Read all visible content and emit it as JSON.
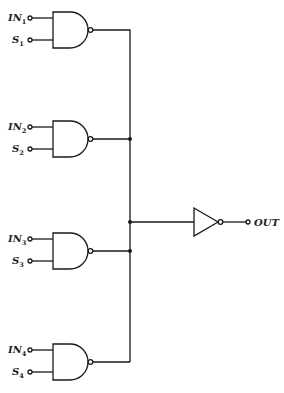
{
  "diagram": {
    "type": "logic-circuit",
    "gates": [
      {
        "id": "nand1",
        "kind": "NAND",
        "inputs": [
          {
            "name": "IN",
            "sub": "1"
          },
          {
            "name": "S",
            "sub": "1"
          }
        ],
        "y": 30
      },
      {
        "id": "nand2",
        "kind": "NAND",
        "inputs": [
          {
            "name": "IN",
            "sub": "2"
          },
          {
            "name": "S",
            "sub": "2"
          }
        ],
        "y": 139
      },
      {
        "id": "nand3",
        "kind": "NAND",
        "inputs": [
          {
            "name": "IN",
            "sub": "3"
          },
          {
            "name": "S",
            "sub": "3"
          }
        ],
        "y": 251
      },
      {
        "id": "nand4",
        "kind": "NAND",
        "inputs": [
          {
            "name": "IN",
            "sub": "4"
          },
          {
            "name": "S",
            "sub": "4"
          }
        ],
        "y": 362
      }
    ],
    "inverter": {
      "id": "not1",
      "kind": "NOT",
      "y": 221
    },
    "output": {
      "label": "OUT"
    },
    "labels": {
      "in1": "IN",
      "in1_sub": "1",
      "s1": "S",
      "s1_sub": "1",
      "in2": "IN",
      "in2_sub": "2",
      "s2": "S",
      "s2_sub": "2",
      "in3": "IN",
      "in3_sub": "3",
      "s3": "S",
      "s3_sub": "3",
      "in4": "IN",
      "in4_sub": "4",
      "s4": "S",
      "s4_sub": "4",
      "out": "OUT"
    },
    "colors": {
      "line": "#1a1a1a",
      "background": "#ffffff"
    }
  }
}
